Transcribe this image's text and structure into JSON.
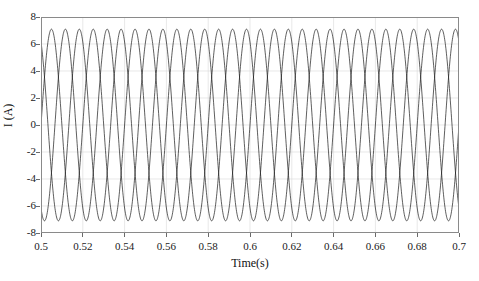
{
  "chart_data": {
    "type": "line",
    "title": "",
    "xlabel": "Time(s)",
    "ylabel": "I (A)",
    "xlim": [
      0.5,
      0.7
    ],
    "ylim": [
      -8,
      8
    ],
    "xticks": [
      0.5,
      0.52,
      0.54,
      0.56,
      0.58,
      0.6,
      0.62,
      0.64,
      0.66,
      0.68,
      0.7
    ],
    "xticklabels": [
      "0.5",
      "0.52",
      "0.54",
      "0.56",
      "0.58",
      "0.6",
      "0.62",
      "0.64",
      "0.66",
      "0.68",
      "0.7"
    ],
    "yticks": [
      -8,
      -6,
      -4,
      -2,
      0,
      2,
      4,
      6,
      8
    ],
    "yticklabels": [
      "-8",
      "-6",
      "-4",
      "-2",
      "0",
      "2",
      "4",
      "6",
      "8"
    ],
    "grid": true,
    "grid_color": "#d9d9d9",
    "line_color": "#1a1a1a",
    "line_width": 0.7,
    "frequency_hz": 50,
    "amplitude_a": 7.1,
    "n_samples": 1400,
    "series": [
      {
        "name": "Phase A",
        "phase_deg": 0,
        "amplitude": 7.1,
        "frequency_hz": 50
      },
      {
        "name": "Phase B",
        "phase_deg": -120,
        "amplitude": 7.1,
        "frequency_hz": 50
      },
      {
        "name": "Phase C",
        "phase_deg": 120,
        "amplitude": 7.1,
        "frequency_hz": 50
      }
    ],
    "legend": [],
    "legend_position": "none"
  }
}
